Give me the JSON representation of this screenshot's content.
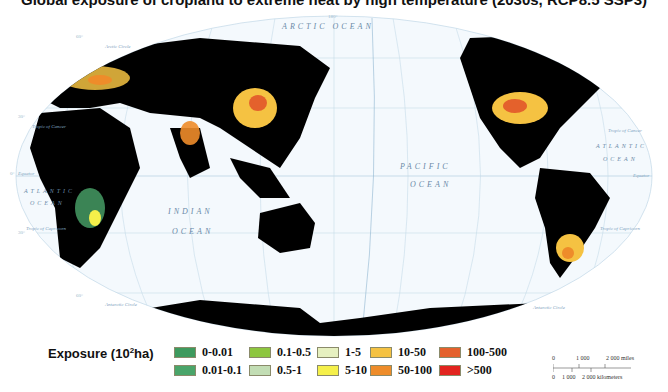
{
  "title": "Global exposure of cropland to extreme heat by high temperature (2030s, RCP8.5 SSP3)",
  "map": {
    "projection": "Robinson (Pacific-centered)",
    "oceans": [
      {
        "name": "ARCTIC OCEAN"
      },
      {
        "name": "PACIFIC",
        "line2": "OCEAN"
      },
      {
        "name": "INDIAN",
        "line2": "OCEAN"
      },
      {
        "name": "ATLANTIC",
        "line2": "OCEAN",
        "side": "west"
      },
      {
        "name": "ATLANTIC",
        "line2": "OCEAN",
        "side": "east"
      }
    ],
    "reference_lines": [
      "Arctic Circle",
      "Tropic of Cancer",
      "Equator",
      "Tropic of Capricorn",
      "Antarctic Circle",
      "International Date Line"
    ],
    "top_longitude_labels": [
      "30°",
      "0°",
      "30°",
      "60°",
      "90°",
      "120°",
      "150°",
      "180°",
      "150°",
      "120°",
      "90°",
      "60°",
      "30°",
      "60°"
    ],
    "bottom_longitude_labels": [
      "30°",
      "0°",
      "30°",
      "60°",
      "90°",
      "120°",
      "150°",
      "180° W",
      "150°",
      "120°",
      "90°",
      "60°",
      "30°",
      "0°"
    ],
    "latitude_labels": [
      "60°",
      "30°",
      "0°",
      "30°",
      "60°"
    ],
    "date_line_label": "INTERNATIONAL DATE LINE",
    "top_center_label": "180°",
    "land_color": "#000000",
    "ocean_color": "#f4f9fd",
    "graticule_color": "#b8d4e6"
  },
  "legend": {
    "title": "Exposure (10",
    "title_sup": "2",
    "title_tail": "ha)",
    "items": [
      {
        "label": "0-0.01",
        "color": "#3e9a5e"
      },
      {
        "label": "0.01-0.1",
        "color": "#4aa56a"
      },
      {
        "label": "0.1-0.5",
        "color": "#8dc63f"
      },
      {
        "label": "0.5-1",
        "color": "#c2ddb4"
      },
      {
        "label": "1-5",
        "color": "#e6f0c0"
      },
      {
        "label": "5-10",
        "color": "#f5f04a"
      },
      {
        "label": "10-50",
        "color": "#f5c242"
      },
      {
        "label": "50-100",
        "color": "#ee8c2a"
      },
      {
        "label": "100-500",
        "color": "#e4612c"
      },
      {
        "label": ">500",
        "color": "#e2241f"
      }
    ]
  },
  "scale_bar": {
    "miles_labels": [
      "0",
      "1 000",
      "2 000 miles"
    ],
    "km_labels": [
      "0",
      "1 000",
      "2 000 kilometers"
    ]
  }
}
